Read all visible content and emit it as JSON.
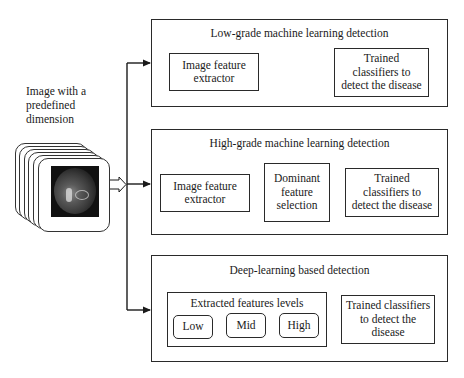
{
  "input": {
    "caption_lines": [
      "Image with a",
      "predefined",
      "dimension"
    ],
    "image_icon": "fundus-retina-image-stack"
  },
  "panels": [
    {
      "title": "Low-grade machine learning detection",
      "steps": [
        {
          "label": "Image feature extractor",
          "lines": [
            "Image feature",
            "extractor"
          ]
        },
        {
          "label": "Trained classifiers to detect the disease",
          "lines": [
            "Trained",
            "classifiers to",
            "detect the disease"
          ]
        }
      ]
    },
    {
      "title": "High-grade machine learning detection",
      "steps": [
        {
          "label": "Image feature extractor",
          "lines": [
            "Image feature",
            "extractor"
          ]
        },
        {
          "label": "Dominant feature selection",
          "lines": [
            "Dominant",
            "feature",
            "selection"
          ]
        },
        {
          "label": "Trained classifiers to detect the disease",
          "lines": [
            "Trained",
            "classifiers to",
            "detect the disease"
          ]
        }
      ]
    },
    {
      "title": "Deep-learning based detection",
      "feature_group": {
        "title": "Extracted features levels",
        "levels": [
          "Low",
          "Mid",
          "High"
        ]
      },
      "steps": [
        {
          "label": "Trained classifiers to detect the disease",
          "lines": [
            "Trained classifiers",
            "to detect the",
            "disease"
          ]
        }
      ]
    }
  ],
  "colors": {
    "line": "#1a1a1a",
    "background": "#ffffff"
  }
}
